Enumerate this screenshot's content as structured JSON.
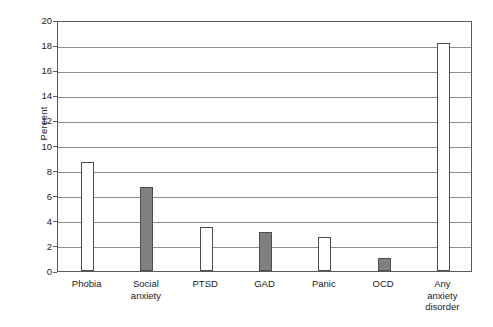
{
  "chart_data": {
    "type": "bar",
    "title": "",
    "xlabel": "",
    "ylabel": "Percent",
    "ylim": [
      0,
      20
    ],
    "ytick_step": 2,
    "yticks": [
      "0",
      "2",
      "4",
      "6",
      "8",
      "10",
      "12",
      "14",
      "16",
      "18",
      "20"
    ],
    "grid": true,
    "legend": "none",
    "categories": [
      "Phobia",
      "Social\nanxiety",
      "PTSD",
      "GAD",
      "Panic",
      "OCD",
      "Any\nanxiety\ndisorder"
    ],
    "values": [
      8.7,
      6.7,
      3.5,
      3.1,
      2.7,
      1.0,
      18.2
    ],
    "bar_fills": [
      "#ffffff",
      "#808080",
      "#ffffff",
      "#808080",
      "#ffffff",
      "#808080",
      "#ffffff"
    ],
    "bar_edge_color": "#4d4d4d",
    "axis_color": "#5a5a5a",
    "grid_color": "#8e8e8e",
    "background": "#ffffff"
  }
}
